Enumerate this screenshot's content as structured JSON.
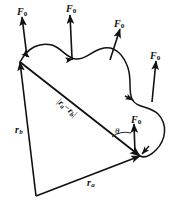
{
  "figure": {
    "type": "mechanics-vector-diagram",
    "stroke_color": "#111111",
    "background_color": "#ffffff",
    "force_labels": [
      {
        "id": "f0-top-left",
        "symbol": "F",
        "subscript": "0",
        "x": 17,
        "y": 7
      },
      {
        "id": "f0-top-mid",
        "symbol": "F",
        "subscript": "0",
        "x": 66,
        "y": 4
      },
      {
        "id": "f0-top-right",
        "symbol": "F",
        "subscript": "0",
        "x": 114,
        "y": 19
      },
      {
        "id": "f0-right",
        "symbol": "F",
        "subscript": "0",
        "x": 150,
        "y": 51
      },
      {
        "id": "f0-lower-right",
        "symbol": "F",
        "subscript": "0",
        "x": 131,
        "y": 115
      }
    ],
    "vector_labels": [
      {
        "id": "r-b",
        "symbol": "r",
        "subscript": "b",
        "x": 15,
        "y": 125
      },
      {
        "id": "r-a",
        "symbol": "r",
        "subscript": "a",
        "x": 87,
        "y": 178
      }
    ],
    "separation_label": {
      "id": "separation",
      "open_bar": "|",
      "symbol_a": "r",
      "subscript_a": "a",
      "minus": "−",
      "symbol_b": "r",
      "subscript_b": "b",
      "close_bar": "|"
    },
    "angle_label": {
      "id": "theta",
      "symbol": "θ",
      "x": 115,
      "y": 127
    },
    "geometry": {
      "origin_vertex": [
        36,
        196
      ],
      "vertex_b": [
        20,
        62
      ],
      "vertex_a": [
        140,
        156
      ]
    }
  }
}
